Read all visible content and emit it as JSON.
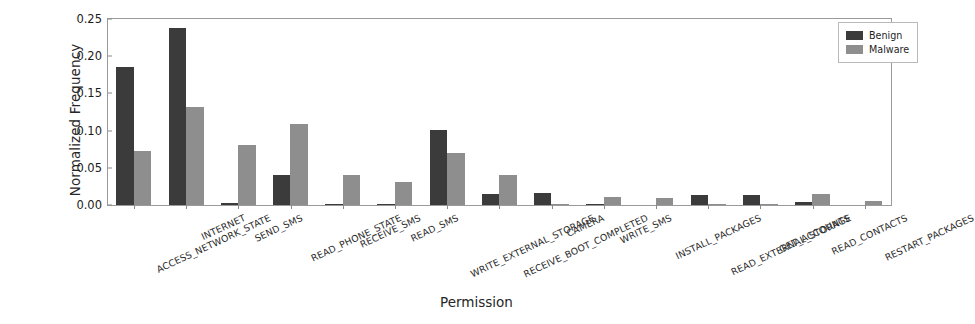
{
  "chart_data": {
    "type": "bar",
    "title": "",
    "xlabel": "Permission",
    "ylabel": "Normalized Frequency",
    "ylim": [
      0.0,
      0.25
    ],
    "yticks": [
      "0.00",
      "0.05",
      "0.10",
      "0.15",
      "0.20",
      "0.25"
    ],
    "ytick_values": [
      0.0,
      0.05,
      0.1,
      0.15,
      0.2,
      0.25
    ],
    "grid": false,
    "legend_position": "upper right",
    "categories": [
      "ACCESS_NETWORK_STATE",
      "INTERNET",
      "SEND_SMS",
      "READ_PHONE_STATE",
      "RECEIVE_SMS",
      "READ_SMS",
      "WRITE_EXTERNAL_STORAGE",
      "RECEIVE_BOOT_COMPLETED",
      "CAMERA",
      "WRITE_SMS",
      "INSTALL_PACKAGES",
      "READ_EXTERNAL_STORAGE",
      "GET_ACCOUNTS",
      "READ_CONTACTS",
      "RESTART_PACKAGES"
    ],
    "series": [
      {
        "name": "Benign",
        "color": "#3b3b3b",
        "values": [
          0.186,
          0.238,
          0.003,
          0.04,
          0.002,
          0.001,
          0.101,
          0.015,
          0.016,
          0.001,
          0.0,
          0.013,
          0.013,
          0.004,
          0.0
        ]
      },
      {
        "name": "Malware",
        "color": "#8e8e8e",
        "values": [
          0.072,
          0.132,
          0.08,
          0.109,
          0.04,
          0.031,
          0.07,
          0.041,
          0.002,
          0.011,
          0.009,
          0.001,
          0.002,
          0.015,
          0.005
        ]
      }
    ]
  },
  "legend": {
    "items": [
      {
        "label": "Benign",
        "color": "#3b3b3b"
      },
      {
        "label": "Malware",
        "color": "#8e8e8e"
      }
    ]
  },
  "axes": {
    "y_title": "Normalized Frequency",
    "x_title": "Permission"
  }
}
